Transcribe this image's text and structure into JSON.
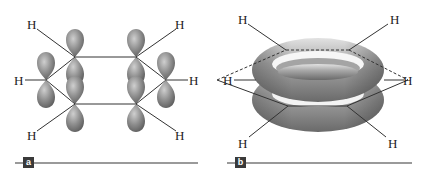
{
  "figure": {
    "panels": [
      {
        "id": "a",
        "label": "a",
        "description": "Six p orbitals on the carbon atoms of the benzene ring",
        "atom_labels": [
          "H",
          "H",
          "H",
          "H",
          "H",
          "H"
        ]
      },
      {
        "id": "b",
        "label": "b",
        "description": "Delocalized pi electron cloud above and below the benzene ring",
        "atom_labels": [
          "H",
          "H",
          "H",
          "H",
          "H",
          "H"
        ]
      }
    ],
    "colors": {
      "orbital_fill": "#8a8a8a",
      "orbital_highlight": "#c8c8c8",
      "bond_line": "#333333",
      "label_box": "#3a3a3a",
      "rule_line": "#9a9a9a"
    }
  }
}
